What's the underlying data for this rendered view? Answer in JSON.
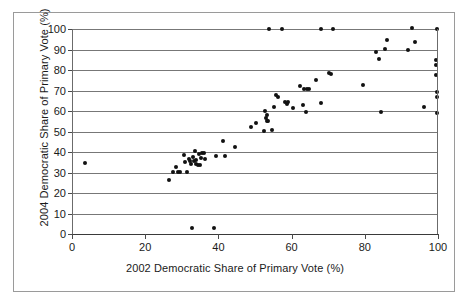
{
  "chart_data": {
    "type": "scatter",
    "title": "",
    "xlabel": "2002 Democratic Share of Primary Vote (%)",
    "ylabel": "2004 Democratic Share of Primary Vote (%)",
    "xlim": [
      0,
      100
    ],
    "ylim": [
      0,
      100
    ],
    "xticks": [
      0,
      20,
      40,
      60,
      80,
      100
    ],
    "yticks": [
      0,
      10,
      20,
      30,
      40,
      50,
      60,
      70,
      80,
      90,
      100
    ],
    "grid": "horizontal",
    "legend": "none",
    "marker": "filled-diamond",
    "marker_color": "#111111",
    "points": [
      [
        3.5,
        34.8
      ],
      [
        26.5,
        26.3
      ],
      [
        27.5,
        30.3
      ],
      [
        28.3,
        32.5
      ],
      [
        29.0,
        30.2
      ],
      [
        29.6,
        30.1
      ],
      [
        30.6,
        38.4
      ],
      [
        31.0,
        35.0
      ],
      [
        31.4,
        30.4
      ],
      [
        32.0,
        36.4
      ],
      [
        32.3,
        35.5
      ],
      [
        32.6,
        34.3
      ],
      [
        32.8,
        3.1
      ],
      [
        33.0,
        37.6
      ],
      [
        33.2,
        35.6
      ],
      [
        33.5,
        40.6
      ],
      [
        33.8,
        34.0
      ],
      [
        34.0,
        36.1
      ],
      [
        34.3,
        33.8
      ],
      [
        34.6,
        38.8
      ],
      [
        34.9,
        33.5
      ],
      [
        35.2,
        37.2
      ],
      [
        35.6,
        39.5
      ],
      [
        36.0,
        39.6
      ],
      [
        36.3,
        36.8
      ],
      [
        38.8,
        3.0
      ],
      [
        39.3,
        38.0
      ],
      [
        41.3,
        45.2
      ],
      [
        41.8,
        38.0
      ],
      [
        44.5,
        42.3
      ],
      [
        48.8,
        52.4
      ],
      [
        50.3,
        54.0
      ],
      [
        52.5,
        50.2
      ],
      [
        52.8,
        60.0
      ],
      [
        53.0,
        56.4
      ],
      [
        53.2,
        58.0
      ],
      [
        53.3,
        54.9
      ],
      [
        53.6,
        55.2
      ],
      [
        53.8,
        100.0
      ],
      [
        54.6,
        50.7
      ],
      [
        55.3,
        62.0
      ],
      [
        55.8,
        68.0
      ],
      [
        56.2,
        66.6
      ],
      [
        57.5,
        100.0
      ],
      [
        58.3,
        64.2
      ],
      [
        58.8,
        63.6
      ],
      [
        59.0,
        64.6
      ],
      [
        60.3,
        61.6
      ],
      [
        62.3,
        72.4
      ],
      [
        63.0,
        62.9
      ],
      [
        63.4,
        70.6
      ],
      [
        64.0,
        59.6
      ],
      [
        64.3,
        70.9
      ],
      [
        64.7,
        70.5
      ],
      [
        66.8,
        75.2
      ],
      [
        67.9,
        100.0
      ],
      [
        68.0,
        64.1
      ],
      [
        70.3,
        78.3
      ],
      [
        70.9,
        78.2
      ],
      [
        71.3,
        100.0
      ],
      [
        79.5,
        72.8
      ],
      [
        83.0,
        88.8
      ],
      [
        83.9,
        85.2
      ],
      [
        84.5,
        59.5
      ],
      [
        85.6,
        90.3
      ],
      [
        86.0,
        94.8
      ],
      [
        91.8,
        89.7
      ],
      [
        92.8,
        100.3
      ],
      [
        93.7,
        93.6
      ],
      [
        96.2,
        61.8
      ],
      [
        99.4,
        85.0
      ],
      [
        99.5,
        82.6
      ],
      [
        99.5,
        77.5
      ],
      [
        99.6,
        69.2
      ],
      [
        99.6,
        67.0
      ],
      [
        99.7,
        59.0
      ],
      [
        99.8,
        100.0
      ]
    ]
  },
  "axes": {
    "y_title": "2004 Democratic Share of Primary Vote (%)",
    "x_title": "2002 Democratic Share of Primary Vote (%)",
    "y_tick_labels": [
      "100",
      "90",
      "80",
      "70",
      "60",
      "50",
      "40",
      "30",
      "20",
      "10",
      "0"
    ],
    "x_tick_labels": [
      "0",
      "20",
      "40",
      "60",
      "80",
      "100"
    ]
  }
}
